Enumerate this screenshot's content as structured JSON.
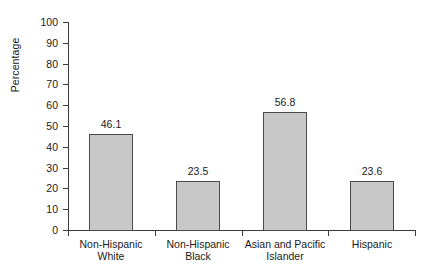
{
  "chart_data": {
    "type": "bar",
    "title": "",
    "xlabel": "",
    "ylabel": "Percentage",
    "ylim": [
      0,
      100
    ],
    "ytick_step": 10,
    "yticks": [
      0,
      10,
      20,
      30,
      40,
      50,
      60,
      70,
      80,
      90,
      100
    ],
    "ytick_labels": [
      "0",
      "10",
      "20",
      "30",
      "40",
      "50",
      "60",
      "70",
      "80",
      "90",
      "100"
    ],
    "grid": false,
    "legend": "none",
    "bar_fill_color": "#c8c8c8",
    "bar_edge_color": "#4a4a4a",
    "axis_color": "#3c3c3c",
    "background_color": "#ffffff",
    "categories": [
      "Non-Hispanic White",
      "Non-Hispanic Black",
      "Asian and Pacific Islander",
      "Hispanic"
    ],
    "category_lines": [
      [
        "Non-Hispanic",
        "White"
      ],
      [
        "Non-Hispanic",
        "Black"
      ],
      [
        "Asian and Pacific",
        "Islander"
      ],
      [
        "Hispanic",
        ""
      ]
    ],
    "values": [
      46.1,
      23.5,
      56.8,
      23.6
    ],
    "value_labels": [
      "46.1",
      "23.5",
      "56.8",
      "23.6"
    ]
  }
}
